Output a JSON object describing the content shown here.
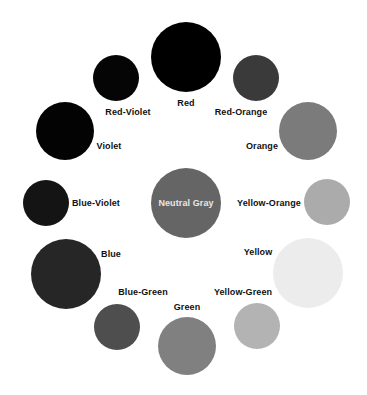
{
  "diagram": {
    "title": "",
    "nodes": [
      {
        "id": "red",
        "label": "Red",
        "color": "#000000",
        "cx": 186,
        "cy": 57,
        "r": 35,
        "lx": 186,
        "ly": 103
      },
      {
        "id": "red-violet",
        "label": "Red-Violet",
        "color": "#050505",
        "cx": 116,
        "cy": 78,
        "r": 23,
        "lx": 128,
        "ly": 112
      },
      {
        "id": "red-orange",
        "label": "Red-Orange",
        "color": "#3a3a3a",
        "cx": 256,
        "cy": 78,
        "r": 23,
        "lx": 241,
        "ly": 112
      },
      {
        "id": "violet",
        "label": "Violet",
        "color": "#030303",
        "cx": 65,
        "cy": 131,
        "r": 29,
        "lx": 109,
        "ly": 146
      },
      {
        "id": "orange",
        "label": "Orange",
        "color": "#7b7b7b",
        "cx": 308,
        "cy": 131,
        "r": 29,
        "lx": 262,
        "ly": 146
      },
      {
        "id": "blue-violet",
        "label": "Blue-Violet",
        "color": "#141414",
        "cx": 46,
        "cy": 203,
        "r": 23,
        "lx": 96,
        "ly": 203
      },
      {
        "id": "neutral-gray",
        "label": "Neutral Gray",
        "color": "#656565",
        "cx": 186,
        "cy": 203,
        "r": 35,
        "lx": 186,
        "ly": 203,
        "inside": true
      },
      {
        "id": "yellow-orange",
        "label": "Yellow-Orange",
        "color": "#ababab",
        "cx": 327,
        "cy": 202,
        "r": 23,
        "lx": 269,
        "ly": 203
      },
      {
        "id": "blue",
        "label": "Blue",
        "color": "#262626",
        "cx": 66,
        "cy": 274,
        "r": 35,
        "lx": 111,
        "ly": 254
      },
      {
        "id": "yellow",
        "label": "Yellow",
        "color": "#ececec",
        "cx": 308,
        "cy": 273,
        "r": 35,
        "lx": 258,
        "ly": 252
      },
      {
        "id": "blue-green",
        "label": "Blue-Green",
        "color": "#4e4e4e",
        "cx": 117,
        "cy": 327,
        "r": 23,
        "lx": 143,
        "ly": 292
      },
      {
        "id": "green",
        "label": "Green",
        "color": "#808080",
        "cx": 187,
        "cy": 346,
        "r": 29,
        "lx": 187,
        "ly": 307
      },
      {
        "id": "yellow-green",
        "label": "Yellow-Green",
        "color": "#b3b3b3",
        "cx": 257,
        "cy": 326,
        "r": 23,
        "lx": 243,
        "ly": 292
      }
    ]
  }
}
